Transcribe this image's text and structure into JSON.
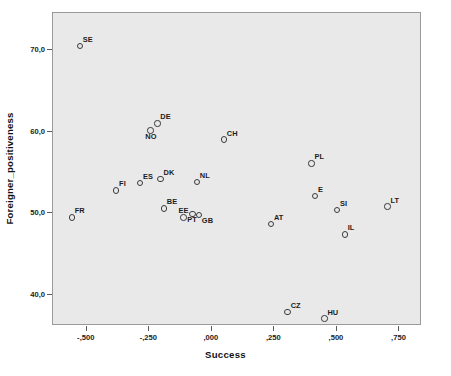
{
  "chart_data": {
    "type": "scatter",
    "title": "",
    "xlabel": "Success",
    "ylabel": "Foreigner_positiveness",
    "xlim": [
      -0.635,
      0.84
    ],
    "ylim": [
      36.2,
      74.5
    ],
    "xticks": [
      "-,500",
      "-,250",
      ",000",
      ",250",
      ",500",
      ",750"
    ],
    "xtick_values": [
      -0.5,
      -0.25,
      0.0,
      0.25,
      0.5,
      0.75
    ],
    "yticks": [
      "40,0",
      "50,0",
      "60,0",
      "70,0"
    ],
    "ytick_values": [
      40.0,
      50.0,
      60.0,
      70.0
    ],
    "grid": false,
    "legend": "none",
    "point_label_field": "country",
    "points": [
      {
        "country": "SE",
        "x": -0.528,
        "y": 70.5,
        "label_pos": "ne"
      },
      {
        "country": "DE",
        "x": -0.218,
        "y": 61.0,
        "label_pos": "ne"
      },
      {
        "country": "NO",
        "x": -0.246,
        "y": 60.1,
        "label_pos": "s"
      },
      {
        "country": "CH",
        "x": 0.048,
        "y": 59.0,
        "label_pos": "ne"
      },
      {
        "country": "PL",
        "x": 0.398,
        "y": 56.1,
        "label_pos": "ne"
      },
      {
        "country": "DK",
        "x": -0.205,
        "y": 54.2,
        "label_pos": "ne"
      },
      {
        "country": "NL",
        "x": -0.06,
        "y": 53.8,
        "label_pos": "ne"
      },
      {
        "country": "ES",
        "x": -0.287,
        "y": 53.7,
        "label_pos": "ne"
      },
      {
        "country": "FI",
        "x": -0.383,
        "y": 52.8,
        "label_pos": "ne"
      },
      {
        "country": "E",
        "x": 0.412,
        "y": 52.1,
        "label_pos": "ne"
      },
      {
        "country": "LT",
        "x": 0.702,
        "y": 50.8,
        "label_pos": "ne"
      },
      {
        "country": "BE",
        "x": -0.192,
        "y": 50.6,
        "label_pos": "ne"
      },
      {
        "country": "SI",
        "x": 0.5,
        "y": 50.4,
        "label_pos": "ne"
      },
      {
        "country": "FR",
        "x": -0.56,
        "y": 49.5,
        "label_pos": "ne"
      },
      {
        "country": "EE",
        "x": -0.113,
        "y": 49.5,
        "label_pos": "n"
      },
      {
        "country": "GB",
        "x": -0.052,
        "y": 49.8,
        "label_pos": "se"
      },
      {
        "country": "PT",
        "x": -0.078,
        "y": 49.9,
        "label_pos": "s"
      },
      {
        "country": "AT",
        "x": 0.236,
        "y": 48.7,
        "label_pos": "ne"
      },
      {
        "country": "IL",
        "x": 0.531,
        "y": 47.4,
        "label_pos": "ne"
      },
      {
        "country": "CZ",
        "x": 0.303,
        "y": 37.9,
        "label_pos": "ne"
      },
      {
        "country": "HU",
        "x": 0.45,
        "y": 37.1,
        "label_pos": "ne"
      }
    ]
  },
  "colors": {
    "plot_background": "#e9e9e9",
    "figure_background": "#ffffff",
    "plot_border": "#9a9a9a",
    "marker_stroke": "#3a3a3a",
    "text": "#1c1c1c",
    "axis": "#5a5a5a"
  }
}
